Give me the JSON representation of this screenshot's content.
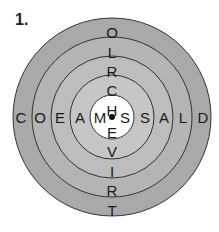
{
  "puzzle": {
    "number_label": "1.",
    "center": {
      "x": 112,
      "y": 117
    },
    "rings": [
      {
        "radius": 99,
        "fill": "#a9a9a9"
      },
      {
        "radius": 80,
        "fill": "#b4b4b4"
      },
      {
        "radius": 61,
        "fill": "#bdbdbd"
      },
      {
        "radius": 42,
        "fill": "#c6c6c6"
      },
      {
        "radius": 22,
        "fill": "#ffffff"
      }
    ],
    "ring_stroke": "#333333",
    "vertical_letters": [
      {
        "letter": "O",
        "y": 33
      },
      {
        "letter": "L",
        "y": 53
      },
      {
        "letter": "R",
        "y": 72
      },
      {
        "letter": "C",
        "y": 91
      },
      {
        "letter": "H",
        "y": 111
      },
      {
        "letter": "E",
        "y": 133
      },
      {
        "letter": "V",
        "y": 152
      },
      {
        "letter": "I",
        "y": 172
      },
      {
        "letter": "R",
        "y": 191
      },
      {
        "letter": "T",
        "y": 211
      }
    ],
    "horizontal_letters": [
      {
        "letter": "C",
        "x": 21
      },
      {
        "letter": "O",
        "x": 40
      },
      {
        "letter": "E",
        "x": 60
      },
      {
        "letter": "A",
        "x": 80
      },
      {
        "letter": "M",
        "x": 100
      },
      {
        "letter": "S",
        "x": 125
      },
      {
        "letter": "S",
        "x": 145
      },
      {
        "letter": "A",
        "x": 164
      },
      {
        "letter": "L",
        "x": 183
      },
      {
        "letter": "D",
        "x": 203
      }
    ],
    "center_dot": true
  }
}
